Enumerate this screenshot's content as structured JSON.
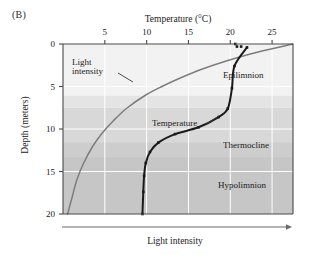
{
  "panel": {
    "label": "(B)"
  },
  "axes": {
    "top": {
      "title": "Temperature (°C)",
      "ticks": [
        5,
        10,
        15,
        20,
        25
      ],
      "range": [
        0,
        27.5
      ]
    },
    "left": {
      "title": "Depth (meters)",
      "ticks": [
        0,
        5,
        10,
        15,
        20
      ],
      "range": [
        0,
        20
      ]
    },
    "bottom": {
      "title": "Light intensity",
      "arrow": true
    }
  },
  "annotations": {
    "light_intensity": "Light\nintensity",
    "temperature": "Temperature"
  },
  "zones": [
    {
      "name": "Epilimnion",
      "label": "Epilimnion",
      "depth_top": 0.0,
      "depth_bottom": 7.5,
      "color": "#f2f2f2"
    },
    {
      "name": "Thermocline",
      "label": "Thermocline",
      "depth_top": 7.5,
      "depth_bottom": 13.2,
      "color": "#d8d8d8"
    },
    {
      "name": "Hypolimnion",
      "label": "Hypolimnion",
      "depth_top": 13.2,
      "depth_bottom": 20.0,
      "color": "#c6c6c6"
    }
  ],
  "colors": {
    "temperature_curve": "#1a1a1a",
    "light_curve": "#7d7d7d",
    "axis": "#4a4a4a",
    "gridline": "#ffffff",
    "band_epilimnion": "#f2f2f2",
    "band_epilimnion_lower": "#e4e4e4",
    "band_thermocline": "#d8d8d8",
    "band_hypolimnion": "#c6c6c6"
  },
  "chart_data": {
    "type": "line",
    "title": "",
    "xlabel": "Temperature (°C)",
    "ylabel": "Depth (meters)",
    "xlim": [
      0,
      27.5
    ],
    "ylim": [
      20,
      0
    ],
    "y_inverted": true,
    "grid": true,
    "legend": "inline-annotations",
    "series": [
      {
        "name": "Temperature",
        "marker": "square",
        "color": "#1a1a1a",
        "x_axis": "top",
        "xlabel": "Temperature (°C)",
        "points": [
          {
            "depth": 0.0,
            "temperature": 20.6
          },
          {
            "depth": 0.3,
            "temperature": 20.8
          },
          {
            "depth": 0.3,
            "temperature": 21.3
          },
          {
            "depth": 0.4,
            "temperature": 22.0
          },
          {
            "depth": 2.6,
            "temperature": 20.5
          },
          {
            "depth": 5.2,
            "temperature": 20.2
          },
          {
            "depth": 7.6,
            "temperature": 19.7
          },
          {
            "depth": 8.6,
            "temperature": 18.6
          },
          {
            "depth": 9.8,
            "temperature": 16.2
          },
          {
            "depth": 10.6,
            "temperature": 13.4
          },
          {
            "depth": 11.6,
            "temperature": 11.4
          },
          {
            "depth": 12.7,
            "temperature": 10.4
          },
          {
            "depth": 14.0,
            "temperature": 9.9
          },
          {
            "depth": 15.5,
            "temperature": 9.7
          },
          {
            "depth": 17.4,
            "temperature": 9.6
          },
          {
            "depth": 20.0,
            "temperature": 9.5
          }
        ]
      },
      {
        "name": "Light intensity",
        "marker": "none",
        "color": "#7d7d7d",
        "x_axis": "bottom",
        "xlabel": "Light intensity",
        "note": "Relative light intensity plotted on unlabeled bottom axis; decays exponentially with depth",
        "points": [
          {
            "depth": 0.0,
            "light_relative": 100
          },
          {
            "depth": 1.0,
            "light_relative": 84
          },
          {
            "depth": 2.0,
            "light_relative": 71
          },
          {
            "depth": 3.0,
            "light_relative": 60
          },
          {
            "depth": 4.0,
            "light_relative": 51
          },
          {
            "depth": 5.0,
            "light_relative": 43
          },
          {
            "depth": 6.0,
            "light_relative": 36
          },
          {
            "depth": 7.5,
            "light_relative": 28
          },
          {
            "depth": 9.0,
            "light_relative": 22
          },
          {
            "depth": 10.5,
            "light_relative": 17
          },
          {
            "depth": 12.0,
            "light_relative": 13
          },
          {
            "depth": 14.0,
            "light_relative": 9
          },
          {
            "depth": 16.0,
            "light_relative": 6
          },
          {
            "depth": 18.0,
            "light_relative": 4
          },
          {
            "depth": 20.0,
            "light_relative": 2
          }
        ]
      }
    ]
  }
}
